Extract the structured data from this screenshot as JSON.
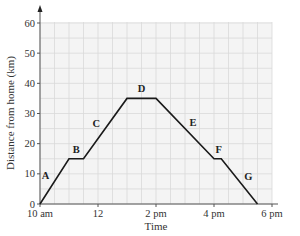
{
  "chart_data": {
    "type": "line",
    "title": "",
    "xlabel": "Time",
    "ylabel": "Distance from home (km)",
    "x_unit": "hours after 10 am",
    "xlim": [
      0,
      8
    ],
    "ylim": [
      0,
      60
    ],
    "grid": true,
    "x_ticks": [
      {
        "value": 0,
        "label": "10 am"
      },
      {
        "value": 2,
        "label": "12"
      },
      {
        "value": 4,
        "label": "2 pm"
      },
      {
        "value": 6,
        "label": "4 pm"
      },
      {
        "value": 8,
        "label": "6 pm"
      }
    ],
    "y_ticks": [
      0,
      10,
      20,
      30,
      40,
      50,
      60
    ],
    "series": [
      {
        "name": "Journey",
        "points": [
          {
            "x": 0,
            "y": 0
          },
          {
            "x": 1,
            "y": 15
          },
          {
            "x": 1.5,
            "y": 15
          },
          {
            "x": 3,
            "y": 35
          },
          {
            "x": 4,
            "y": 35
          },
          {
            "x": 6,
            "y": 15
          },
          {
            "x": 6.25,
            "y": 15
          },
          {
            "x": 7.5,
            "y": 0
          }
        ]
      }
    ],
    "segments": [
      {
        "label": "A",
        "from": [
          0,
          0
        ],
        "to": [
          1,
          15
        ]
      },
      {
        "label": "B",
        "from": [
          1,
          15
        ],
        "to": [
          1.5,
          15
        ]
      },
      {
        "label": "C",
        "from": [
          1.5,
          15
        ],
        "to": [
          3,
          35
        ]
      },
      {
        "label": "D",
        "from": [
          3,
          35
        ],
        "to": [
          4,
          35
        ]
      },
      {
        "label": "E",
        "from": [
          4,
          35
        ],
        "to": [
          6,
          15
        ]
      },
      {
        "label": "F",
        "from": [
          6,
          15
        ],
        "to": [
          6.25,
          15
        ]
      },
      {
        "label": "G",
        "from": [
          6.25,
          15
        ],
        "to": [
          7.5,
          0
        ]
      }
    ]
  },
  "colors": {
    "line": "#1a1a1a",
    "grid": "#d9d9d9",
    "plot_bg": "#f4f4f4",
    "axis": "#555555"
  }
}
